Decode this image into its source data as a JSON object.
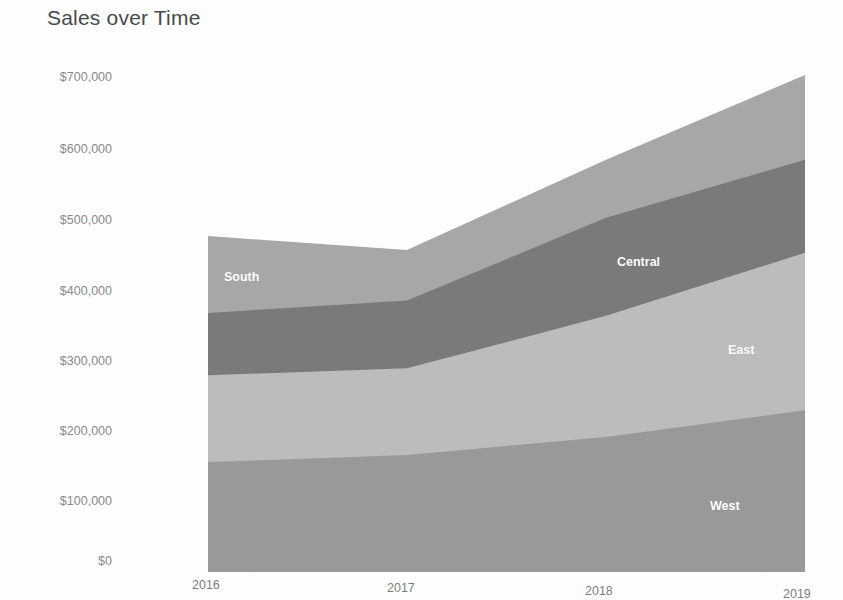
{
  "chart_data": {
    "type": "area",
    "title": "Sales over Time",
    "xlabel": "",
    "ylabel": "",
    "stacked": true,
    "grid": false,
    "legend": "inline-labels",
    "x": [
      "2016",
      "2017",
      "2018",
      "2019"
    ],
    "categories": [
      "2016",
      "2017",
      "2018",
      "2019"
    ],
    "ylim": [
      0,
      700000
    ],
    "ytick_labels": [
      "$700,000",
      "$600,000",
      "$500,000",
      "$400,000",
      "$300,000",
      "$200,000",
      "$100,000",
      "$0"
    ],
    "ytick_values": [
      700000,
      600000,
      500000,
      400000,
      300000,
      200000,
      100000,
      0
    ],
    "xtick_labels": [
      "2016",
      "2017",
      "2018",
      "2019"
    ],
    "series": [
      {
        "name": "West",
        "color": "#9a9a9a",
        "values": [
          157000,
          167000,
          193000,
          231000
        ],
        "cumulative_top": [
          157000,
          167000,
          193000,
          231000
        ]
      },
      {
        "name": "East",
        "color": "#bdbdbd",
        "values": [
          124000,
          124000,
          173000,
          225000
        ],
        "cumulative_top": [
          281000,
          291000,
          366000,
          456000
        ]
      },
      {
        "name": "Central",
        "color": "#7b7b7b",
        "values": [
          89000,
          97000,
          140000,
          133000
        ],
        "cumulative_top": [
          370000,
          388000,
          506000,
          589000
        ]
      },
      {
        "name": "South",
        "color": "#a8a8a8",
        "values": [
          110000,
          72000,
          83000,
          121000
        ],
        "cumulative_top": [
          480000,
          460000,
          589000,
          710000
        ]
      }
    ],
    "series_label_positions": [
      {
        "name": "South",
        "x_px": 224,
        "y_px": 270
      },
      {
        "name": "Central",
        "x_px": 617,
        "y_px": 255
      },
      {
        "name": "East",
        "x_px": 728,
        "y_px": 343
      },
      {
        "name": "West",
        "x_px": 710,
        "y_px": 499
      }
    ],
    "plot_area_px": {
      "left": 208,
      "right": 805,
      "top": 60,
      "bottom": 572
    },
    "ytick_y_px": [
      78,
      150,
      221,
      292,
      362,
      432,
      502,
      562
    ],
    "xtick_px": [
      {
        "label": "2016",
        "x": 192,
        "y": 578
      },
      {
        "label": "2017",
        "x": 387,
        "y": 581
      },
      {
        "label": "2018",
        "x": 585,
        "y": 584
      },
      {
        "label": "2019",
        "x": 783,
        "y": 587
      }
    ],
    "background_color": "#ffffff",
    "title_color": "#4a4a4a",
    "tick_color": "#8a8a8a"
  }
}
